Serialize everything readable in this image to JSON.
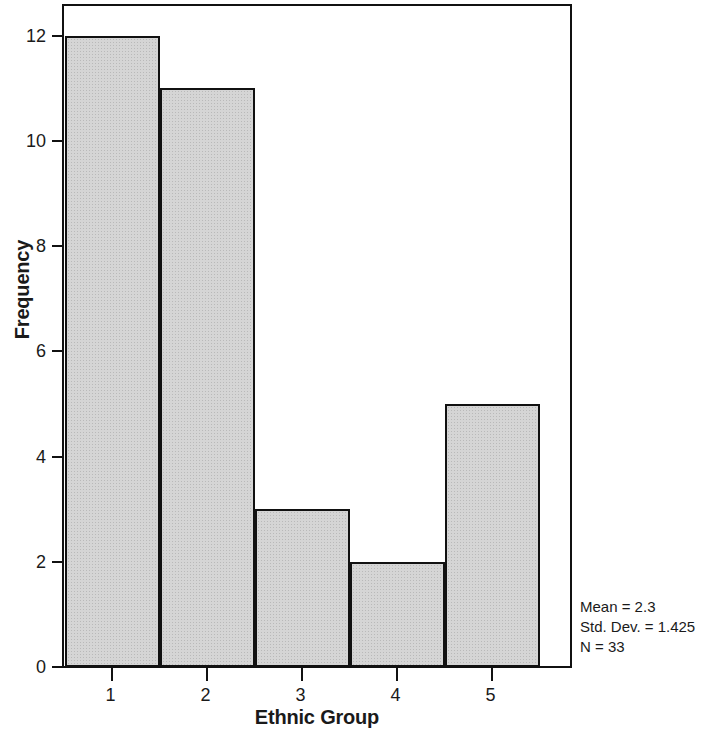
{
  "chart_data": {
    "type": "bar",
    "title": "",
    "subtitle": "",
    "xlabel": "Ethnic Group",
    "ylabel": "Frequency",
    "categories": [
      "1",
      "2",
      "3",
      "4",
      "5"
    ],
    "values": [
      12,
      11,
      3,
      2,
      5
    ],
    "series": [
      {
        "name": "Frequency",
        "values": [
          12,
          11,
          3,
          2,
          5
        ]
      }
    ],
    "ylim": [
      0,
      12.6
    ],
    "xlim": [
      0.5,
      5.5
    ],
    "y_ticks": [
      0,
      2,
      4,
      6,
      8,
      10,
      12
    ],
    "y_tick_labels": [
      "0",
      "2",
      "4",
      "6",
      "8",
      "10",
      "12"
    ],
    "x_ticks": [
      1,
      2,
      3,
      4,
      5
    ],
    "x_tick_labels": [
      "1",
      "2",
      "3",
      "4",
      "5"
    ],
    "grid": false,
    "legend": false,
    "bar_fill_color": "#d5d5d5",
    "bar_edge_color": "#111111",
    "background_color": "#ffffff",
    "annotations": {
      "position": "bottom-right-outside",
      "lines": [
        "Mean = 2.3",
        "Std. Dev. = 1.425",
        "N = 33"
      ],
      "mean": "2.3",
      "std_dev": "1.425",
      "n": "33"
    }
  }
}
